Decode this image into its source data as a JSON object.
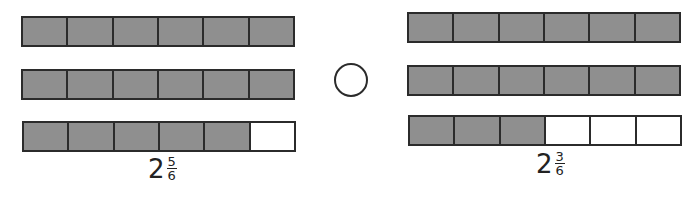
{
  "colors": {
    "shaded": "#8f8f8f",
    "empty": "#ffffff",
    "stroke": "#2b2b2b"
  },
  "left_model": {
    "parts_per_bar": 6,
    "bars": [
      {
        "shaded": 6
      },
      {
        "shaded": 6
      },
      {
        "shaded": 5
      }
    ],
    "label": {
      "whole": "2",
      "numerator": "5",
      "denominator": "6"
    }
  },
  "comparison": {
    "symbol": ""
  },
  "right_model": {
    "parts_per_bar": 6,
    "bars": [
      {
        "shaded": 6
      },
      {
        "shaded": 6
      },
      {
        "shaded": 3
      }
    ],
    "label": {
      "whole": "2",
      "numerator": "3",
      "denominator": "6"
    }
  }
}
